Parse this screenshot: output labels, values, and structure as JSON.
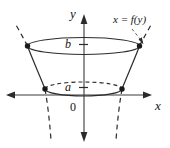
{
  "figure": {
    "name": "solid-of-revolution-frustum",
    "background_color": "#ffffff",
    "ink_color": "#2b2b2b",
    "axis_color": "#3a3a3a",
    "width": 170,
    "height": 148
  },
  "axes": {
    "y_axis": {
      "label": "y",
      "x_position": 84,
      "top": 16,
      "bottom": 141,
      "arrows": "both"
    },
    "x_axis": {
      "label": "x",
      "y_position": 95,
      "left": 6,
      "right": 152,
      "arrows": "both"
    },
    "origin_label": "0"
  },
  "annotations": {
    "curve_label": {
      "text": "x = f(y)",
      "parts": {
        "variable_x": "x",
        "equals": "=",
        "function": "f",
        "open_paren": "(",
        "argument": "y",
        "close_paren": ")"
      }
    },
    "upper_bound_label": "b",
    "lower_bound_label": "a"
  },
  "geometry": {
    "upper_disk": {
      "label": "b",
      "center_x": 83.5,
      "center_y": 46,
      "radius_x": 56,
      "radius_y": 8.5,
      "style": "solid"
    },
    "lower_disk": {
      "label": "a",
      "center_x": 83.5,
      "center_y": 89,
      "radius_x": 38.5,
      "radius_y": 7,
      "style": "front-solid-back-dashed"
    },
    "vertices": [
      {
        "name": "upper-left",
        "x": 27.5,
        "y": 46
      },
      {
        "name": "upper-right",
        "x": 139.5,
        "y": 46
      },
      {
        "name": "lower-left",
        "x": 45,
        "y": 89
      },
      {
        "name": "lower-right",
        "x": 122,
        "y": 89
      }
    ]
  }
}
